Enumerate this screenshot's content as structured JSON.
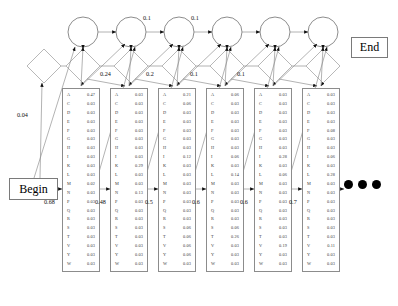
{
  "figure": {
    "type": "profile-hidden-markov-model",
    "begin_label": "Begin",
    "end_label": "End",
    "ellipsis": "•••"
  },
  "amino_acids": [
    "A",
    "C",
    "D",
    "E",
    "F",
    "G",
    "H",
    "I",
    "K",
    "L",
    "M",
    "N",
    "P",
    "Q",
    "R",
    "S",
    "T",
    "V",
    "Y",
    "W"
  ],
  "match_states": [
    {
      "index": 1,
      "x": 62,
      "probs": [
        "0.47",
        "0.03",
        "0.03",
        "0.03",
        "0.03",
        "0.03",
        "0.03",
        "0.03",
        "0.03",
        "0.03",
        "0.02",
        "0.03",
        "0.03",
        "0.03",
        "0.03",
        "0.03",
        "0.03",
        "0.03",
        "0.03",
        "0.03"
      ]
    },
    {
      "index": 2,
      "x": 110,
      "probs": [
        "0.03",
        "0.03",
        "0.03",
        "0.03",
        "0.03",
        "0.03",
        "0.03",
        "0.03",
        "0.29",
        "0.03",
        "0.03",
        "0.13",
        "0.03",
        "0.03",
        "0.03",
        "0.03",
        "0.03",
        "0.03",
        "0.03",
        "0.03"
      ]
    },
    {
      "index": 3,
      "x": 158,
      "probs": [
        "0.21",
        "0.06",
        "0.03",
        "0.03",
        "0.03",
        "0.03",
        "0.03",
        "0.12",
        "0.03",
        "0.03",
        "0.03",
        "0.03",
        "0.03",
        "0.03",
        "0.03",
        "0.06",
        "0.06",
        "0.06",
        "0.06",
        "0.03"
      ]
    },
    {
      "index": 4,
      "x": 206,
      "probs": [
        "0.06",
        "0.03",
        "0.03",
        "0.03",
        "0.03",
        "0.03",
        "0.03",
        "0.06",
        "0.03",
        "0.14",
        "0.03",
        "0.03",
        "0.03",
        "0.03",
        "0.03",
        "0.06",
        "0.26",
        "0.03",
        "0.03",
        "0.03"
      ]
    },
    {
      "index": 5,
      "x": 254,
      "probs": [
        "0.03",
        "0.03",
        "0.03",
        "0.03",
        "0.03",
        "0.03",
        "0.03",
        "0.28",
        "0.03",
        "0.06",
        "0.03",
        "0.03",
        "0.03",
        "0.03",
        "0.03",
        "0.03",
        "0.03",
        "0.19",
        "0.03",
        "0.03"
      ]
    },
    {
      "index": 6,
      "x": 302,
      "probs": [
        "0.03",
        "0.03",
        "0.03",
        "0.03",
        "0.08",
        "0.03",
        "0.03",
        "0.06",
        "0.03",
        "0.28",
        "0.03",
        "0.03",
        "0.03",
        "0.03",
        "0.03",
        "0.03",
        "0.03",
        "0.11",
        "0.03",
        "0.03"
      ]
    }
  ],
  "transition_labels": [
    {
      "name": "begin-to-match1",
      "text": "0.68",
      "x": 44,
      "y": 198
    },
    {
      "name": "match1-to-match2",
      "text": "0.48",
      "x": 95,
      "y": 198
    },
    {
      "name": "match2-to-match3",
      "text": "0.5",
      "x": 145,
      "y": 198
    },
    {
      "name": "match3-to-match4",
      "text": "0.6",
      "x": 192,
      "y": 198
    },
    {
      "name": "match4-to-match5",
      "text": "0.6",
      "x": 240,
      "y": 198
    },
    {
      "name": "match5-to-match6",
      "text": "0.7",
      "x": 289,
      "y": 198
    },
    {
      "name": "begin-to-delete1",
      "text": "0.04",
      "x": 17,
      "y": 111
    },
    {
      "name": "delete1-to-delete2",
      "text": "0.24",
      "x": 100,
      "y": 70
    },
    {
      "name": "delete2-to-delete3",
      "text": "0.2",
      "x": 146,
      "y": 70
    },
    {
      "name": "delete3-to-delete4",
      "text": "0.1",
      "x": 190,
      "y": 70
    },
    {
      "name": "delete4-to-delete5",
      "text": "0.1",
      "x": 237,
      "y": 70
    },
    {
      "name": "insert2-to-insert3",
      "text": "0.1",
      "x": 143,
      "y": 14
    },
    {
      "name": "insert3-to-insert4",
      "text": "0.1",
      "x": 191,
      "y": 14
    }
  ],
  "insert_states": [
    {
      "name": "insert-state-1",
      "cx": 83,
      "cy": 32,
      "r": 15
    },
    {
      "name": "insert-state-2",
      "cx": 131,
      "cy": 32,
      "r": 15
    },
    {
      "name": "insert-state-3",
      "cx": 179,
      "cy": 32,
      "r": 15
    },
    {
      "name": "insert-state-4",
      "cx": 227,
      "cy": 32,
      "r": 15
    },
    {
      "name": "insert-state-5",
      "cx": 275,
      "cy": 32,
      "r": 15
    },
    {
      "name": "insert-state-6",
      "cx": 323,
      "cy": 32,
      "r": 15
    }
  ],
  "delete_states": [
    {
      "name": "delete-state-0",
      "cx": 44,
      "cy": 66,
      "r": 17
    },
    {
      "name": "delete-state-1",
      "cx": 83,
      "cy": 66,
      "r": 17
    },
    {
      "name": "delete-state-2",
      "cx": 131,
      "cy": 66,
      "r": 17
    },
    {
      "name": "delete-state-3",
      "cx": 179,
      "cy": 66,
      "r": 17
    },
    {
      "name": "delete-state-4",
      "cx": 227,
      "cy": 66,
      "r": 17
    },
    {
      "name": "delete-state-5",
      "cx": 275,
      "cy": 66,
      "r": 17
    },
    {
      "name": "delete-state-6",
      "cx": 323,
      "cy": 66,
      "r": 17
    }
  ]
}
